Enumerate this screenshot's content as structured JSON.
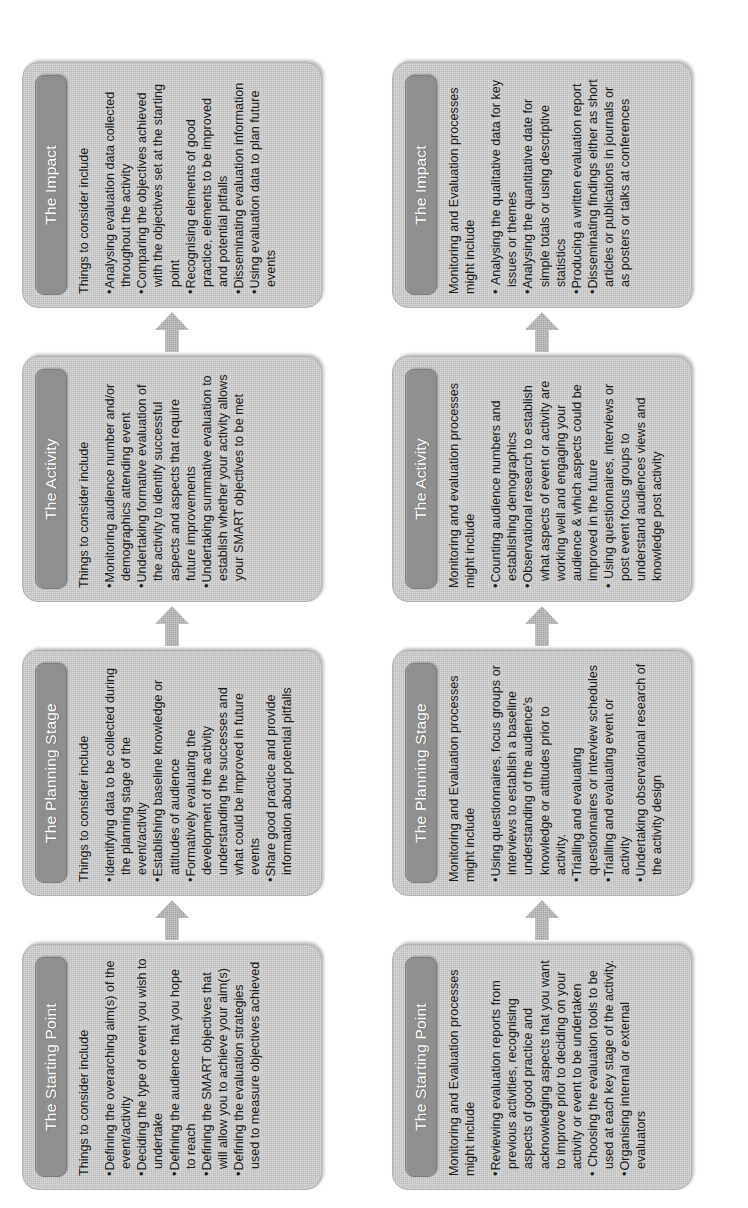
{
  "diagram": {
    "orientation": "rotated-90",
    "colors": {
      "box_fill": "#c9c9c9",
      "header_fill": "#8f8f8f",
      "header_text": "#ffffff",
      "body_text": "#1d1d1d",
      "arrow_fill": "#b0b0b0",
      "page_background": "#ffffff"
    },
    "arrow_icon": "arrow-right-icon",
    "rows": [
      {
        "id": "things-to-consider",
        "stages": [
          {
            "header": "The Starting Point",
            "intro": "Things to consider include",
            "bullets": [
              "Defining the overarching aim(s) of the event/activity",
              "Deciding the type of event you wish to undertake",
              "Defining the audience that you hope to reach",
              "Defining the SMART objectives that will allow you to achieve your aim(s)",
              "Defining the evaluation strategies used to measure objectives achieved"
            ]
          },
          {
            "header": "The Planning Stage",
            "intro": "Things to consider include",
            "bullets": [
              "Identifying data to be collected during the planning stage of the event/activity",
              "Establishing baseline knowledge or attitudes of audience",
              "Formatively evaluating the development of the activity understanding the successes and what could be improved in future events",
              "Share good practice and provide information about potential pitfalls"
            ]
          },
          {
            "header": "The Activity",
            "intro": "Things to consider include",
            "bullets": [
              "Monitoring audience number and/or demographics attending event",
              "Undertaking formative evaluation of the activity to identify successful aspects and aspects that require future improvements",
              "Undertaking summative evaluation to establish whether your activity allows your SMART objectives to be met"
            ]
          },
          {
            "header": "The Impact",
            "intro": "Things to consider include",
            "bullets": [
              "Analysing evaluation data collected throughout the activity",
              "Comparing the objectives achieved with the objectives set at the starting point",
              "Recognising elements of good practice, elements to be improved and potential pitfalls",
              "Disseminating evaluation information",
              "Using evaluation data to plan future events"
            ]
          }
        ]
      },
      {
        "id": "monitoring-and-evaluation-processes",
        "stages": [
          {
            "header": "The Starting Point",
            "intro": "Monitoring and Evaluation processes might include",
            "bullets": [
              "Reviewing evaluation reports from previous activities, recognising aspects of good practice and acknowledging aspects that you want to improve prior to deciding on your activity or event to be undertaken",
              "Choosing the evaluation tools to be used at each key stage of the activity.",
              "Organising internal or external evaluators"
            ]
          },
          {
            "header": "The Planning Stage",
            "intro": "Monitoring and Evaluation processes might include",
            "bullets": [
              "Using questionnaires, focus groups or interviews to establish a baseline understanding of the audience's knowledge or attitudes prior to activity.",
              "Trialling and evaluating questionnaires or interview schedules",
              "Trialling and evaluating event or activity",
              "Undertaking observational research of the activity design"
            ]
          },
          {
            "header": "The Activity",
            "intro": "Monitoring and evaluation processes might include",
            "bullets": [
              "Counting audience numbers and establishing demographics",
              "Observational research to establish what aspects of event or activity are working well and engaging your audience & which aspects could be improved in the future",
              "Using questionnaires, interviews or post event focus groups to understand audiences views and knowledge post activity"
            ]
          },
          {
            "header": "The Impact",
            "intro": "Monitoring and Evaluation processes might include",
            "bullets": [
              "Analysing the qualitative data for key issues or themes",
              "Analysing the quantitative date for simple totals or using descriptive statistics",
              "Producing a written evaluation report",
              "Disseminating findings either as short articles or publications in journals or as posters or talks at conferences"
            ]
          }
        ]
      }
    ]
  }
}
